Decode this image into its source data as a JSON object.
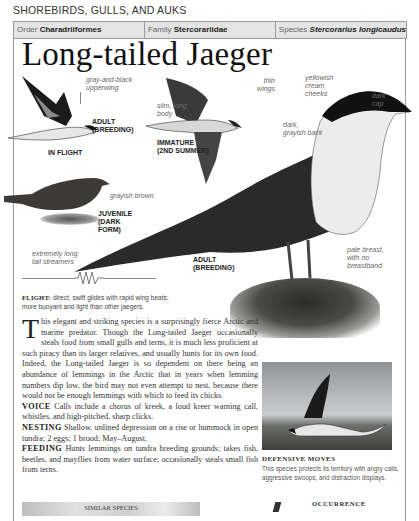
{
  "section_heading": "SHOREBIRDS, GULLS, AND AUKS",
  "taxonomy": {
    "order_label": "Order",
    "order_value": "Charadriiformes",
    "family_label": "Family",
    "family_value": "Stercorariidae",
    "species_label": "Species",
    "species_value": "Stercorarius longicaudus"
  },
  "title": "Long-tailed Jaeger",
  "illustrations": {
    "in_flight": {
      "callout": "gray-and-black upperwing",
      "caption_line1": "ADULT",
      "caption_line2": "(BREEDING)",
      "label": "IN FLIGHT"
    },
    "immature": {
      "callout_body": "slim, long body",
      "callout_wings": "thin wings",
      "caption_line1": "IMMATURE",
      "caption_line2": "(2ND SUMMER)"
    },
    "juvenile": {
      "callout": "grayish brown",
      "caption_line1": "JUVENILE",
      "caption_line2": "(DARK",
      "caption_line3": "FORM)"
    },
    "adult_main": {
      "callout_cap_1": "dark",
      "callout_cap_2": "cap",
      "callout_cheeks_1": "yellowish",
      "callout_cheeks_2": "cream",
      "callout_cheeks_3": "cheeks",
      "callout_back_1": "dark,",
      "callout_back_2": "grayish back",
      "callout_tail_1": "extremely long",
      "callout_tail_2": "tail streamers",
      "callout_breast_1": "pale breast,",
      "callout_breast_2": "with no",
      "callout_breast_3": "breastband",
      "caption_line1": "ADULT",
      "caption_line2": "(BREEDING)"
    }
  },
  "flight": {
    "label": "FLIGHT:",
    "text": "direct, swift glides with rapid wing beats; more buoyant and light than other jaegers."
  },
  "body": {
    "dropcap": "T",
    "intro": "his elegant and striking species is a surprisingly fierce Arctic and marine predator. Though the Long-tailed Jaeger occasionally steals food from small gulls and terns, it is much less proficient at such piracy than its larger relatives, and usually hunts for its own food. Indeed, the Long-tailed Jaeger is so dependent on there being an abundance of lemmings in the Arctic that in years when lemming numbers dip low, the bird may not even attempt to nest, because there would not be enough lemmings with which to feed its chicks.",
    "voice_label": "VOICE",
    "voice_text": "Calls include a chorus of kreek, a loud kreer warning call, whistles, and high-pitched, sharp clicks.",
    "nesting_label": "NESTING",
    "nesting_text": "Shallow, unlined depression on a rise or hummock in open tundra; 2 eggs; 1 brood; May–August.",
    "feeding_label": "FEEDING",
    "feeding_text": "Hunts lemmings on tundra breeding grounds; takes fish, beetles, and mayflies from water surface; occasionally steals small fish from terns."
  },
  "defensive": {
    "title": "DEFENSIVE MOVES",
    "text": "This species protects its territory with angry calls, aggressive swoops, and distraction displays."
  },
  "similar_species_label": "SIMILAR SPECIES",
  "occurrence_label": "OCCURRENCE"
}
